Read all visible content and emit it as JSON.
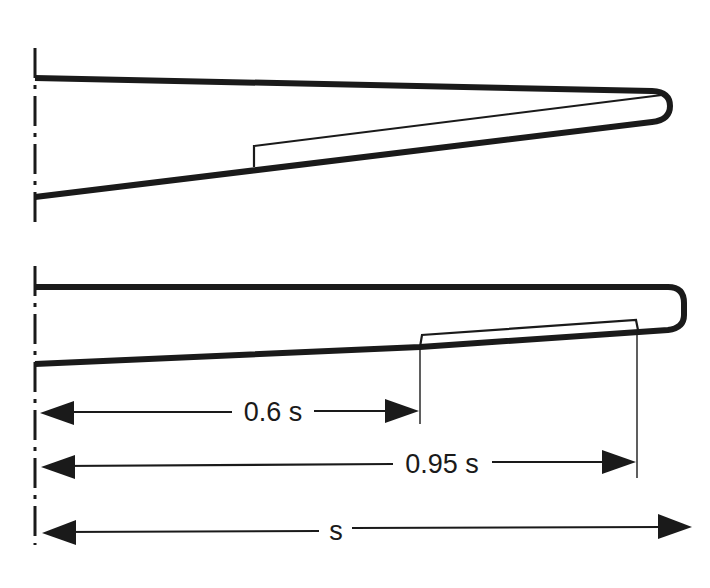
{
  "diagram": {
    "type": "wing planform comparison with flap span dimensions",
    "figures": [
      {
        "id": "tapered-swept-wing",
        "description": "Tapered, swept wing half-span with flap inboard-start at mid span",
        "has_flap": true
      },
      {
        "id": "rectangular-wing",
        "description": "Near-rectangular wing half-span with flap from 0.6 s to 0.95 s",
        "has_flap": true
      }
    ],
    "dimensions": [
      {
        "id": "flap-start",
        "label": "0.6 s",
        "fraction": 0.6
      },
      {
        "id": "flap-end",
        "label": "0.95 s",
        "fraction": 0.95
      },
      {
        "id": "semi-span",
        "label": "s",
        "fraction": 1.0
      }
    ],
    "colors": {
      "ink": "#1a1a1a",
      "background": "#ffffff"
    }
  }
}
